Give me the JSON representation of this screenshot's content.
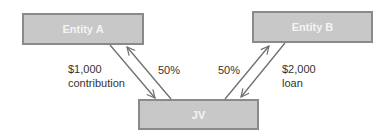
{
  "entities": {
    "entity_a": {
      "label": "Entity A"
    },
    "entity_b": {
      "label": "Entity B"
    },
    "jv": {
      "label": "JV"
    }
  },
  "flows": {
    "a_to_jv": {
      "line1": "$1,000",
      "line2": "contribution"
    },
    "jv_to_a": {
      "label": "50%"
    },
    "jv_to_b": {
      "label": "50%"
    },
    "b_to_jv": {
      "line1": "$2,000",
      "line2": "loan"
    }
  },
  "colors": {
    "box_fill": "#c8c8c8",
    "box_border": "#8a8a8a",
    "box_text": "#f4f4f4",
    "arrow": "#6e6e6e",
    "label_text": "#333333"
  }
}
